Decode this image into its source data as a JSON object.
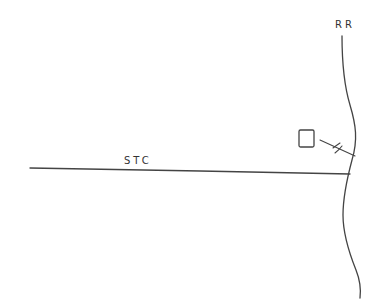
{
  "diagram": {
    "type": "hand-drawn sketch",
    "labels": {
      "road_vertical": "RR",
      "road_horizontal": "STC"
    },
    "elements": [
      {
        "id": "rr",
        "kind": "curved-line",
        "label": "RR"
      },
      {
        "id": "stc",
        "kind": "straight-line",
        "label": "STC"
      },
      {
        "id": "box",
        "kind": "small-square"
      },
      {
        "id": "connector",
        "kind": "line-with-crossing-marks"
      }
    ],
    "stroke_color": "#444444",
    "background": "#ffffff"
  }
}
